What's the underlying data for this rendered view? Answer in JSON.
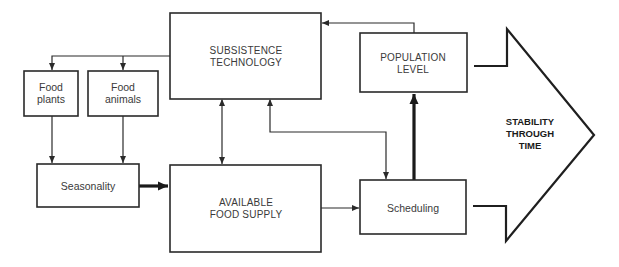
{
  "diagram": {
    "type": "flowchart",
    "nodes": {
      "subsistence_technology": {
        "line1": "SUBSISTENCE",
        "line2": "TECHNOLOGY"
      },
      "food_plants": {
        "line1": "Food",
        "line2": "plants"
      },
      "food_animals": {
        "line1": "Food",
        "line2": "animals"
      },
      "seasonality": {
        "label": "Seasonality"
      },
      "available_food_supply": {
        "line1": "AVAILABLE",
        "line2": "FOOD SUPPLY"
      },
      "population_level": {
        "line1": "POPULATION",
        "line2": "LEVEL"
      },
      "scheduling": {
        "label": "Scheduling"
      },
      "stability_through_time": {
        "line1": "STABILITY",
        "line2": "THROUGH",
        "line3": "TIME"
      }
    },
    "edges": [
      {
        "from": "SUBSISTENCE TECHNOLOGY",
        "to": "Food plants",
        "style": "thin"
      },
      {
        "from": "SUBSISTENCE TECHNOLOGY",
        "to": "Food animals",
        "style": "thin"
      },
      {
        "from": "Food plants",
        "to": "Seasonality",
        "style": "thin"
      },
      {
        "from": "Food animals",
        "to": "Seasonality",
        "style": "thin"
      },
      {
        "from": "Seasonality",
        "to": "AVAILABLE FOOD SUPPLY",
        "style": "thick"
      },
      {
        "from": "SUBSISTENCE TECHNOLOGY",
        "to": "AVAILABLE FOOD SUPPLY",
        "style": "thin-bidirectional"
      },
      {
        "from": "AVAILABLE FOOD SUPPLY",
        "to": "Scheduling",
        "style": "thin"
      },
      {
        "from": "Scheduling",
        "to": "SUBSISTENCE TECHNOLOGY",
        "style": "thin-bidirectional"
      },
      {
        "from": "Scheduling",
        "to": "POPULATION LEVEL",
        "style": "thick"
      },
      {
        "from": "POPULATION LEVEL",
        "to": "SUBSISTENCE TECHNOLOGY",
        "style": "thin"
      },
      {
        "from": "POPULATION LEVEL",
        "to": "STABILITY THROUGH TIME",
        "style": "block-arrow"
      },
      {
        "from": "Scheduling",
        "to": "STABILITY THROUGH TIME",
        "style": "block-arrow"
      }
    ],
    "colors": {
      "stroke": "#2a2a2a",
      "text": "#3a3a3a",
      "background": "#ffffff"
    }
  }
}
